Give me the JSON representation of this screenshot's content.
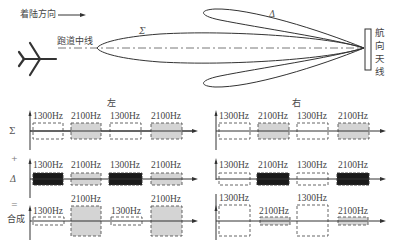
{
  "top": {
    "landing_direction": "着陆方向",
    "runway_centerline": "跑道中线",
    "sum_symbol": "Σ",
    "diff_symbol": "Δ",
    "antenna_label_chars": [
      "航",
      "向",
      "天",
      "线"
    ]
  },
  "panels": {
    "left": {
      "title": "左"
    },
    "right": {
      "title": "右"
    }
  },
  "rows": {
    "sum": {
      "label": "Σ"
    },
    "plus": {
      "label": "+"
    },
    "diff": {
      "label": "Δ"
    },
    "equals": {
      "label": "="
    },
    "combined": {
      "label": "合成"
    }
  },
  "freq": {
    "f1": "1300Hz",
    "f2": "2100Hz"
  },
  "colors": {
    "line": "#333333",
    "dash_box": "#555555",
    "gray_fill": "#d4d4d4",
    "black_fill": "#1a1a1a"
  }
}
